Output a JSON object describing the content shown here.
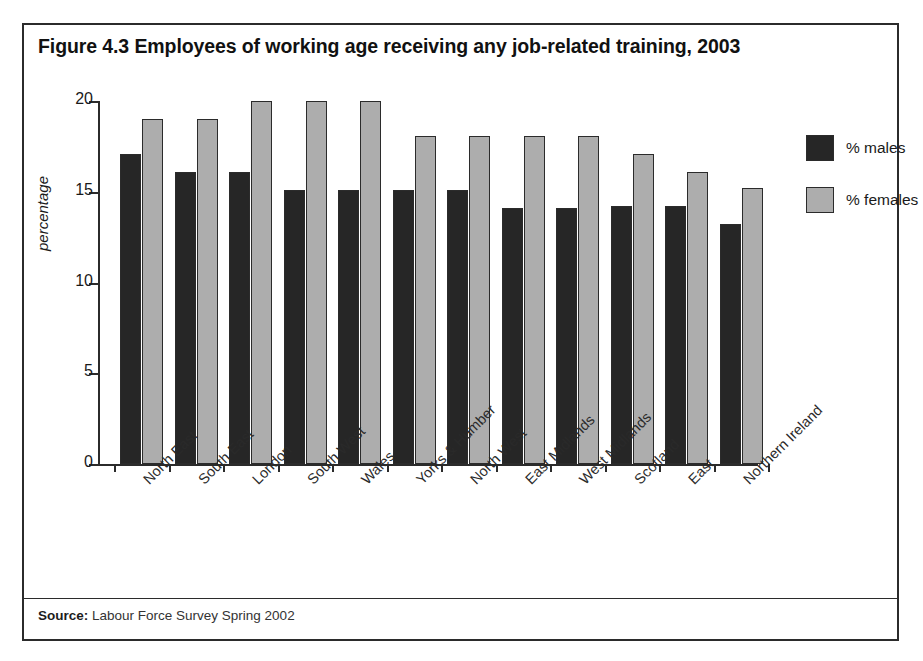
{
  "figure": {
    "title": "Figure 4.3 Employees of working age receiving any job-related training, 2003",
    "source_label": "Source:",
    "source_text": " Labour Force Survey Spring 2002"
  },
  "legend": {
    "position": "right",
    "items": [
      {
        "label": "% males",
        "color": "#262626"
      },
      {
        "label": "% females",
        "color": "#adadad"
      }
    ]
  },
  "chart_data": {
    "type": "bar",
    "title": "Figure 4.3 Employees of working age receiving any job-related training, 2003",
    "xlabel": "",
    "ylabel": "percentage",
    "ylim": [
      0,
      20
    ],
    "yticks": [
      0,
      5,
      10,
      15,
      20
    ],
    "ytick_labels": [
      "0",
      "5",
      "10",
      "15",
      "20"
    ],
    "grid": false,
    "legend_position": "right",
    "categories": [
      "North East",
      "South East",
      "London",
      "South West",
      "Wales",
      "Yorks & Humber",
      "North West",
      "East Midlands",
      "West Midlands",
      "Scotland",
      "East",
      "Northern Ireland"
    ],
    "series": [
      {
        "name": "% males",
        "color": "#262626",
        "values": [
          17.1,
          16.1,
          16.1,
          15.1,
          15.1,
          15.1,
          15.1,
          14.1,
          14.1,
          14.2,
          14.2,
          13.2
        ]
      },
      {
        "name": "% females",
        "color": "#adadad",
        "values": [
          19.0,
          19.0,
          20.0,
          20.0,
          20.0,
          18.1,
          18.1,
          18.1,
          18.1,
          17.1,
          16.1,
          15.2
        ]
      }
    ]
  }
}
